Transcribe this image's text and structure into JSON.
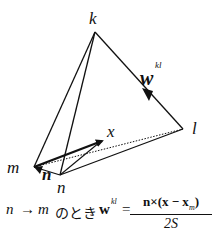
{
  "diagram": {
    "vertices": {
      "k": {
        "label": "k",
        "x": 95,
        "y": 32
      },
      "l": {
        "label": "l",
        "x": 183,
        "y": 129
      },
      "m": {
        "label": "m",
        "x": 34,
        "y": 167
      },
      "n": {
        "label": "n",
        "x": 60,
        "y": 175
      }
    },
    "point_x": {
      "label": "x",
      "x": 103,
      "y": 140
    },
    "vector_w": {
      "label": "w",
      "superscript": "kl"
    },
    "normal_n": {
      "label": "n"
    },
    "colors": {
      "stroke": "#111111",
      "background": "#ffffff"
    }
  },
  "formula": {
    "lhs_n": "n",
    "arrow": "→",
    "lhs_m": "m",
    "japanese": "のとき",
    "w": "w",
    "w_sup": "kl",
    "equals": "=",
    "numerator": "n×(x − x",
    "numerator_sub": "m",
    "numerator_close": ")",
    "denominator": "2S"
  }
}
